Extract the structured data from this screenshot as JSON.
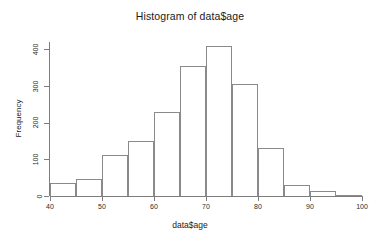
{
  "chart_data": {
    "type": "bar",
    "title": "Histogram of data$age",
    "xlabel": "data$age",
    "ylabel": "Frequency",
    "xlim": [
      40,
      100
    ],
    "ylim": [
      0,
      420
    ],
    "grid": false,
    "legend": null,
    "bin_width": 5,
    "x_ticks": [
      "40",
      "50",
      "60",
      "70",
      "80",
      "90",
      "100"
    ],
    "x_tick_values": [
      40,
      50,
      60,
      70,
      80,
      90,
      100
    ],
    "y_ticks": [
      "0",
      "100",
      "200",
      "300",
      "400"
    ],
    "y_tick_values": [
      0,
      100,
      200,
      300,
      400
    ],
    "categories": [
      "40-45",
      "45-50",
      "50-55",
      "55-60",
      "60-65",
      "65-70",
      "70-75",
      "75-80",
      "80-85",
      "85-90",
      "90-95",
      "95-100"
    ],
    "bin_starts": [
      40,
      45,
      50,
      55,
      60,
      65,
      70,
      75,
      80,
      85,
      90,
      95
    ],
    "bin_ends": [
      45,
      50,
      55,
      60,
      65,
      70,
      75,
      80,
      85,
      90,
      95,
      100
    ],
    "values": [
      35,
      47,
      112,
      150,
      230,
      355,
      410,
      305,
      130,
      30,
      13,
      2
    ]
  },
  "style": {
    "bar_border_color": "#8a8a8a",
    "bar_fill_color": "transparent",
    "axis_color": "#7d7d7d",
    "text_color": "#1a1a1a",
    "background_color": "#ffffff"
  }
}
